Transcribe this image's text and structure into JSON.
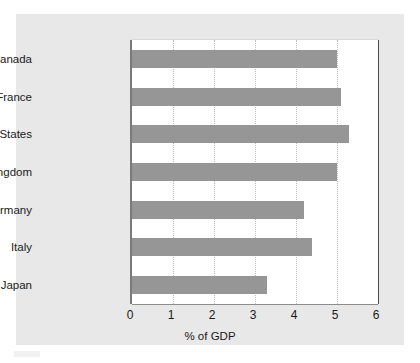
{
  "chart_data": {
    "type": "bar",
    "orientation": "horizontal",
    "title": "",
    "xlabel": "% of GDP",
    "ylabel": "",
    "xlim": [
      0,
      6
    ],
    "xticks": [
      "0",
      "1",
      "2",
      "3",
      "4",
      "5",
      "6"
    ],
    "grid": "vertical-dotted",
    "legend": "none",
    "categories": [
      "Canada",
      "France",
      "United States",
      "United Kingdom",
      "Germany",
      "Italy",
      "Japan"
    ],
    "values": [
      5.0,
      5.1,
      5.3,
      5.0,
      4.2,
      4.4,
      3.3
    ],
    "bar_color": "#969696",
    "panel_color": "#e8e8e8",
    "plot_background": "#ffffff",
    "axis_color": "#7a7a7a",
    "gridline_color": "#bdbdbd"
  }
}
